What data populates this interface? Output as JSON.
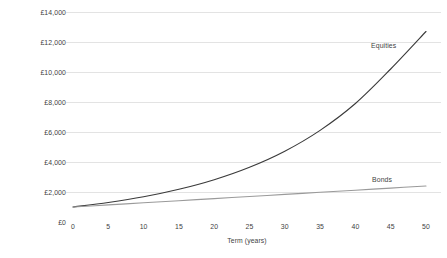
{
  "chart_data": {
    "type": "line",
    "title": "",
    "xlabel": "Term (years)",
    "ylabel": "Projected value of investments",
    "xlim": [
      0,
      50
    ],
    "ylim": [
      0,
      14000
    ],
    "grid": "horizontal",
    "legend_position": "inline-right-of-series",
    "x_ticks": [
      "0",
      "5",
      "10",
      "15",
      "20",
      "25",
      "30",
      "35",
      "40",
      "45",
      "50"
    ],
    "x_tick_values": [
      0,
      5,
      10,
      15,
      20,
      25,
      30,
      35,
      40,
      45,
      50
    ],
    "y_ticks": [
      "£0",
      "£2,000",
      "£4,000",
      "£6,000",
      "£8,000",
      "£10,000",
      "£12,000",
      "£14,000"
    ],
    "y_tick_values": [
      0,
      2000,
      4000,
      6000,
      8000,
      10000,
      12000,
      14000
    ],
    "x": [
      0,
      5,
      10,
      15,
      20,
      25,
      30,
      35,
      40,
      45,
      50
    ],
    "series": [
      {
        "name": "Equities",
        "color": "#3a3a3a",
        "values": [
          1000,
          1300,
          1680,
          2180,
          2820,
          3650,
          4720,
          6110,
          7900,
          10200,
          12700
        ]
      },
      {
        "name": "Bonds",
        "color": "#9a9a9a",
        "values": [
          1000,
          1140,
          1280,
          1420,
          1560,
          1700,
          1840,
          1980,
          2120,
          2260,
          2400
        ]
      }
    ],
    "annotations": [
      {
        "text": "Equities",
        "x": 50,
        "y": 13000
      },
      {
        "text": "Bonds",
        "x": 50,
        "y": 3350
      }
    ],
    "colors": {
      "background": "#ffffff",
      "gridline": "#e3e3e3",
      "text": "#3f3f3f",
      "equities": "#3a3a3a",
      "bonds": "#9a9a9a"
    }
  }
}
